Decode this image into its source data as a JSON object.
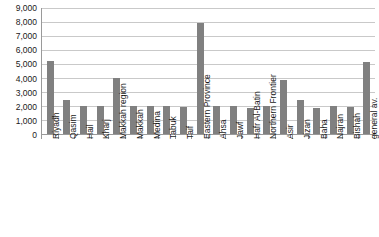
{
  "chart_data": {
    "type": "bar",
    "title": "",
    "subtitle": "",
    "xlabel": "",
    "ylabel": "",
    "ylim": [
      0,
      9000
    ],
    "y_ticks": [
      9000,
      8000,
      7000,
      6000,
      5000,
      4000,
      3000,
      2000,
      1000,
      0
    ],
    "y_tick_labels": [
      "9,000",
      "8,000",
      "7,000",
      "6,000",
      "5,000",
      "4,000",
      "3,000",
      "2,000",
      "1,000",
      "0"
    ],
    "grid": true,
    "legend": false,
    "legend_position": "none",
    "bar_color": "#808080",
    "gridline_color": "#c9c9c9",
    "axis_color": "#9a9a9a",
    "categories": [
      "Riyadh",
      "Qasim",
      "Hail",
      "Kharj",
      "Makkah region",
      "Makkah",
      "Medina",
      "Tabuk",
      "Taif",
      "Eastern Province",
      "Ahsa",
      "Jawf",
      "Hafr Al-Batin",
      "Northern Frontier",
      "Asir",
      "Jizan",
      "Baha",
      "Najran",
      "Bishah",
      "general av."
    ],
    "values": [
      5200,
      2400,
      1950,
      1950,
      3950,
      2000,
      1950,
      1950,
      1900,
      7900,
      1950,
      2000,
      1850,
      2000,
      3800,
      2400,
      1850,
      2000,
      1900,
      5100
    ]
  }
}
